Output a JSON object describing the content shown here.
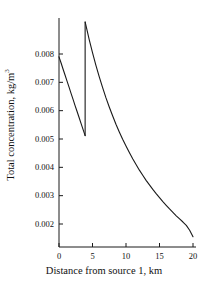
{
  "chart_data": {
    "type": "line",
    "title": "",
    "xlabel": "Distance from source 1, km",
    "ylabel_text": "Total concentration, kg/m",
    "ylabel_exponent": "3",
    "xlim": [
      0,
      20
    ],
    "ylim": [
      0.0015,
      0.00935
    ],
    "grid": false,
    "legend": null,
    "xticks": [
      0,
      5,
      10,
      15,
      20
    ],
    "xtick_labels": [
      "0",
      "5",
      "10",
      "15",
      "20"
    ],
    "yticks": [
      0.002,
      0.003,
      0.004,
      0.005,
      0.006,
      0.007,
      0.008
    ],
    "ytick_labels": [
      "0.002",
      "0.003",
      "0.004",
      "0.005",
      "0.006",
      "0.007",
      "0.008"
    ],
    "line_color": "#1a1a1a",
    "line_width": 1.1,
    "discontinuity_x": 3.9,
    "series": [
      {
        "name": "Total concentration",
        "segment_1": {
          "x": [
            0.0,
            0.3,
            0.6,
            0.9,
            1.2,
            1.5,
            1.8,
            2.1,
            2.4,
            2.7,
            3.0,
            3.3,
            3.6,
            3.9
          ],
          "y": [
            0.0079,
            0.00769,
            0.00747,
            0.00726,
            0.00704,
            0.00683,
            0.00661,
            0.0064,
            0.00618,
            0.00597,
            0.00576,
            0.00554,
            0.00533,
            0.00512
          ]
        },
        "jump": {
          "x": 3.9,
          "y_from": 0.00512,
          "y_to": 0.00913
        },
        "segment_2": {
          "x": [
            3.9,
            4.5,
            5.0,
            5.5,
            6.0,
            6.5,
            7.0,
            7.5,
            8.0,
            8.5,
            9.0,
            9.5,
            10.0,
            10.5,
            11.0,
            11.5,
            12.0,
            12.5,
            13.0,
            13.5,
            14.0,
            14.5,
            15.0,
            15.5,
            16.0,
            16.5,
            17.0,
            17.5,
            18.0,
            18.5,
            19.0,
            19.5,
            20.0
          ],
          "y": [
            0.00913,
            0.00852,
            0.00805,
            0.00761,
            0.0072,
            0.00682,
            0.00646,
            0.00613,
            0.00582,
            0.00552,
            0.00525,
            0.00499,
            0.00475,
            0.00452,
            0.0043,
            0.0041,
            0.0039,
            0.00372,
            0.00354,
            0.00338,
            0.00322,
            0.00307,
            0.00293,
            0.00279,
            0.00266,
            0.00253,
            0.00241,
            0.00229,
            0.00218,
            0.00207,
            0.00195,
            0.00178,
            0.00155
          ]
        }
      }
    ]
  },
  "axes_geometry": {
    "left_px": 59,
    "right_px": 193,
    "bottom_px": 247,
    "top_px": 18
  }
}
